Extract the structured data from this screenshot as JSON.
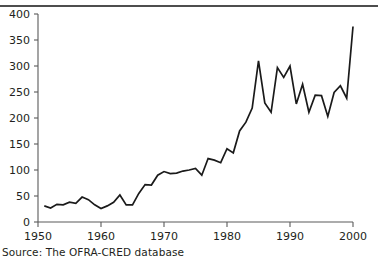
{
  "caption": {
    "source_text": "Source: The OFRA-CRED database"
  },
  "chart_data": {
    "type": "line",
    "title": "",
    "subtitle": "",
    "xlabel": "",
    "ylabel": "",
    "xlim": [
      1950,
      2000
    ],
    "ylim": [
      0,
      400
    ],
    "grid": false,
    "legend": null,
    "legend_position": "none",
    "line_color": "#1a1a1a",
    "axis_color": "#5a5a5a",
    "y_ticks": [
      0,
      50,
      100,
      150,
      200,
      250,
      300,
      350,
      400
    ],
    "y_tick_labels": [
      "0",
      "50",
      "100",
      "150",
      "200",
      "250",
      "300",
      "350",
      "400"
    ],
    "x_ticks": [
      1950,
      1960,
      1970,
      1980,
      1990,
      2000
    ],
    "x_tick_labels": [
      "1950",
      "1960",
      "1970",
      "1980",
      "1990",
      "2000"
    ],
    "x": [
      1951,
      1952,
      1953,
      1954,
      1955,
      1956,
      1957,
      1958,
      1959,
      1960,
      1961,
      1962,
      1963,
      1964,
      1965,
      1966,
      1967,
      1968,
      1969,
      1970,
      1971,
      1972,
      1973,
      1974,
      1975,
      1976,
      1977,
      1978,
      1979,
      1980,
      1981,
      1982,
      1983,
      1984,
      1985,
      1986,
      1987,
      1988,
      1989,
      1990,
      1991,
      1992,
      1993,
      1994,
      1995,
      1996,
      1997,
      1998,
      1999,
      2000
    ],
    "values": [
      31,
      27,
      34,
      33,
      38,
      36,
      48,
      43,
      33,
      26,
      31,
      38,
      52,
      33,
      33,
      55,
      72,
      71,
      90,
      97,
      93,
      94,
      98,
      100,
      103,
      90,
      122,
      119,
      114,
      141,
      133,
      175,
      192,
      219,
      310,
      229,
      211,
      297,
      278,
      300,
      227,
      265,
      211,
      244,
      243,
      203,
      249,
      262,
      238,
      376
    ],
    "series": [
      {
        "name": "Number of reported disasters",
        "values": [
          31,
          27,
          34,
          33,
          38,
          36,
          48,
          43,
          33,
          26,
          31,
          38,
          52,
          33,
          33,
          55,
          72,
          71,
          90,
          97,
          93,
          94,
          98,
          100,
          103,
          90,
          122,
          119,
          114,
          141,
          133,
          175,
          192,
          219,
          310,
          229,
          211,
          297,
          278,
          300,
          227,
          265,
          211,
          244,
          243,
          203,
          249,
          262,
          238,
          376
        ]
      }
    ]
  }
}
